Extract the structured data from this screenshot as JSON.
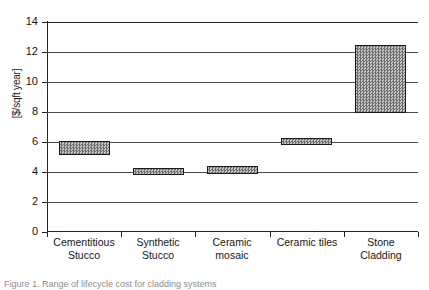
{
  "chart_data": {
    "type": "bar",
    "title": "",
    "xlabel": "",
    "ylabel": "[$/sqft year]",
    "ylim": [
      0,
      14
    ],
    "yticks": [
      0,
      2,
      4,
      6,
      8,
      10,
      12,
      14
    ],
    "ytick_labels": [
      "0",
      "2",
      "4",
      "6",
      "8",
      "10",
      "12",
      "14"
    ],
    "grid": true,
    "legend": "none",
    "bar_style": "floating range bars (low-high), hatched grey fill, black outline",
    "categories": [
      "Cementitious Stucco",
      "Synthetic Stucco",
      "Ceramic mosaic",
      "Ceramic tiles",
      "Stone Cladding"
    ],
    "category_lines": [
      [
        "Cementitious",
        "Stucco"
      ],
      [
        "Synthetic",
        "Stucco"
      ],
      [
        "Ceramic",
        "mosaic"
      ],
      [
        "Ceramic tiles"
      ],
      [
        "Stone",
        "Cladding"
      ]
    ],
    "series": [
      {
        "name": "low",
        "values": [
          5.1,
          3.85,
          3.85,
          5.85,
          7.9
        ]
      },
      {
        "name": "high",
        "values": [
          6.05,
          4.3,
          4.4,
          6.3,
          12.45
        ]
      }
    ],
    "ranges": [
      {
        "category": "Cementitious Stucco",
        "low": 5.1,
        "high": 6.05
      },
      {
        "category": "Synthetic Stucco",
        "low": 3.85,
        "high": 4.3
      },
      {
        "category": "Ceramic mosaic",
        "low": 3.85,
        "high": 4.4
      },
      {
        "category": "Ceramic tiles",
        "low": 5.85,
        "high": 6.3
      },
      {
        "category": "Stone Cladding",
        "low": 7.9,
        "high": 12.45
      }
    ]
  },
  "caption": {
    "text": "Figure 1. Range of lifecycle cost for cladding systems"
  },
  "colors": {
    "bar_fill": "#9b9b9b",
    "bar_border": "#1a1a1a",
    "axis": "#242424",
    "grid": "#4a4a4a",
    "text": "#171717",
    "background": "#ffffff"
  }
}
